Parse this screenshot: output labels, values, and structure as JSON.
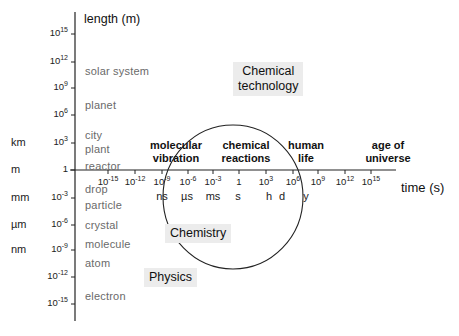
{
  "diagram": {
    "y_axis": {
      "title": "length (m)",
      "ticks": [
        {
          "base": "10",
          "exp": "15",
          "y": 34
        },
        {
          "base": "10",
          "exp": "12",
          "y": 62
        },
        {
          "base": "10",
          "exp": "9",
          "y": 88
        },
        {
          "base": "10",
          "exp": "6",
          "y": 115
        },
        {
          "base": "10",
          "exp": "3",
          "y": 143
        },
        {
          "base": "1",
          "exp": "",
          "y": 170
        },
        {
          "base": "10",
          "exp": "-3",
          "y": 198
        },
        {
          "base": "10",
          "exp": "-6",
          "y": 225
        },
        {
          "base": "10",
          "exp": "-9",
          "y": 250
        },
        {
          "base": "10",
          "exp": "-12",
          "y": 277
        },
        {
          "base": "10",
          "exp": "-15",
          "y": 304
        }
      ],
      "units": [
        {
          "label": "km",
          "y": 143
        },
        {
          "label": "m",
          "y": 170
        },
        {
          "label": "mm",
          "y": 198
        },
        {
          "label": "µm",
          "y": 225
        },
        {
          "label": "nm",
          "y": 250
        }
      ],
      "objects": [
        {
          "label": "solar system",
          "y": 73
        },
        {
          "label": "planet",
          "y": 107
        },
        {
          "label": "city",
          "y": 137
        },
        {
          "label": "plant",
          "y": 151
        },
        {
          "label": "reactor",
          "y": 168
        },
        {
          "label": "drop",
          "y": 191
        },
        {
          "label": "particle",
          "y": 207
        },
        {
          "label": "crystal",
          "y": 227
        },
        {
          "label": "molecule",
          "y": 246
        },
        {
          "label": "atom",
          "y": 265
        },
        {
          "label": "electron",
          "y": 298
        }
      ]
    },
    "x_axis": {
      "title": "time (s)",
      "ticks": [
        {
          "base": "10",
          "exp": "-15",
          "x": 108
        },
        {
          "base": "10",
          "exp": "-12",
          "x": 135
        },
        {
          "base": "10",
          "exp": "-9",
          "x": 162
        },
        {
          "base": "10",
          "exp": "-6",
          "x": 188
        },
        {
          "base": "10",
          "exp": "-3",
          "x": 213
        },
        {
          "base": "1",
          "exp": "",
          "x": 239
        },
        {
          "base": "10",
          "exp": "3",
          "x": 266
        },
        {
          "base": "10",
          "exp": "6",
          "x": 293
        },
        {
          "base": "10",
          "exp": "9",
          "x": 318
        },
        {
          "base": "10",
          "exp": "12",
          "x": 345
        },
        {
          "base": "10",
          "exp": "15",
          "x": 371
        }
      ],
      "time_units": [
        {
          "label": "ns",
          "x": 162
        },
        {
          "label": "µs",
          "x": 187
        },
        {
          "label": "ms",
          "x": 213
        },
        {
          "label": "s",
          "x": 238
        },
        {
          "label": "h",
          "x": 269
        },
        {
          "label": "d",
          "x": 282
        },
        {
          "label": "y",
          "x": 306
        }
      ]
    },
    "events": [
      {
        "line1": "molecular",
        "line2": "vibration",
        "x": 176
      },
      {
        "line1": "chemical",
        "line2": "reactions",
        "x": 246
      },
      {
        "line1": "human",
        "line2": "life",
        "x": 306
      },
      {
        "line1": "age of",
        "line2": "universe",
        "x": 388
      }
    ],
    "fields": {
      "chemical_technology": {
        "line1": "Chemical",
        "line2": "technology"
      },
      "chemistry": "Chemistry",
      "physics": "Physics"
    }
  }
}
